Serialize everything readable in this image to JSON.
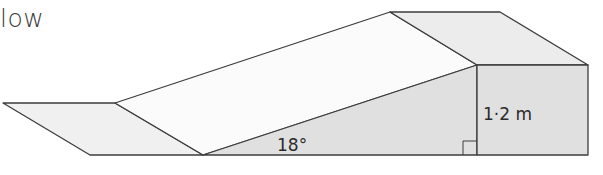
{
  "header": {
    "text": "low"
  },
  "diagram": {
    "angle_label": "18°",
    "height_label": "1·2 m",
    "colors": {
      "stroke": "#3c3c3c",
      "face_light": "#f1f1f1",
      "face_white": "#fbfbfb",
      "face_grey": "#e0e0e0",
      "face_top": "#ececec"
    }
  }
}
